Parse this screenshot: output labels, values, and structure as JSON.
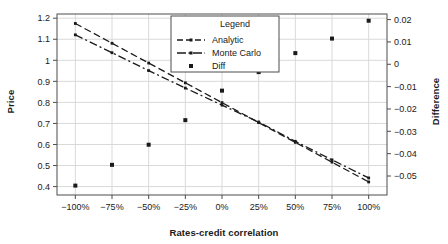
{
  "chart_data": {
    "type": "line",
    "title": "",
    "xlabel": "Rates-credit correlation",
    "ylabel": "Price",
    "ylabel_right": "Difference",
    "grid": true,
    "legend_position": "top-center",
    "legend_title": "Legend",
    "x": [
      -100,
      -75,
      -50,
      -25,
      0,
      25,
      50,
      75,
      100
    ],
    "xticklabels": [
      "−100%",
      "−75%",
      "−50%",
      "−25%",
      "0%",
      "25%",
      "50%",
      "75%",
      "100%"
    ],
    "xlim": [
      -112.5,
      112.5
    ],
    "ylim": [
      0.36,
      1.22
    ],
    "yticks": [
      0.4,
      0.5,
      0.6,
      0.7,
      0.8,
      0.9,
      1.0,
      1.1,
      1.2
    ],
    "yticklabels": [
      "0.4",
      "0.5",
      "0.6",
      "0.7",
      "0.8",
      "0.9",
      "1",
      "1.1",
      "1.2"
    ],
    "ylim_right": [
      -0.0585,
      0.0225
    ],
    "yticks_right": [
      0.02,
      0.01,
      0,
      -0.01,
      -0.02,
      -0.03,
      -0.04,
      -0.05
    ],
    "yticklabels_right": [
      "0.02",
      "0.01",
      "0",
      "−0.01",
      "−0.02",
      "−0.03",
      "−0.04",
      "−0.05"
    ],
    "series": [
      {
        "name": "Analytic",
        "axis": "left",
        "style": "dashed",
        "values": [
          1.175,
          1.081,
          0.987,
          0.893,
          0.799,
          0.704,
          0.61,
          0.516,
          0.422
        ]
      },
      {
        "name": "Monte Carlo",
        "axis": "left",
        "style": "dashdot",
        "values": [
          1.121,
          1.036,
          0.951,
          0.868,
          0.787,
          0.707,
          0.615,
          0.527,
          0.441
        ]
      },
      {
        "name": "Diff",
        "axis": "right",
        "style": "points",
        "values": [
          -0.0543,
          -0.045,
          -0.036,
          -0.025,
          -0.0118,
          -0.0035,
          0.005,
          0.0115,
          0.0195
        ]
      }
    ]
  },
  "legend": {
    "title": "Legend",
    "entries": [
      {
        "label": "Analytic",
        "marker": "dashed-line-marker"
      },
      {
        "label": "Monte Carlo",
        "marker": "dashdot-line-marker"
      },
      {
        "label": "Diff",
        "marker": "square-point-marker"
      }
    ]
  },
  "colors": {
    "line": "#1a1a1a",
    "grid": "#d9d9d9",
    "frame": "#4d4d4d",
    "background": "#ffffff",
    "text": "#1a1a1a"
  }
}
